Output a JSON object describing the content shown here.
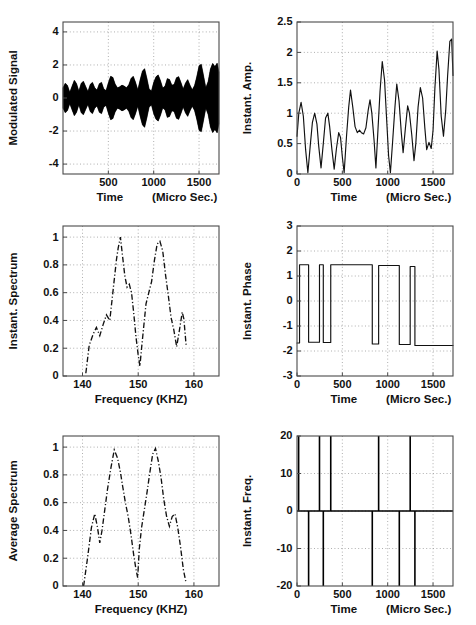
{
  "figure": {
    "width": 476,
    "height": 625,
    "background": "#ffffff",
    "line_color": "#111111",
    "grid_color": "#9a9a9a",
    "axis_color": "#4a4a4a",
    "panel_count": 6
  },
  "panels": [
    {
      "id": "modulated-signal",
      "ylabel": "Modulated Signal",
      "xlabel_left": "Time",
      "xlabel_right": "(Micro Sec.)",
      "xticks": [
        500,
        1000,
        1500
      ],
      "xticklabels": [
        "500",
        "1000",
        "1500"
      ],
      "yticks": [
        -4,
        -2,
        0,
        2,
        4
      ],
      "yticklabels": [
        "-4",
        "-2",
        "0",
        "2",
        "4"
      ],
      "xlim": [
        0,
        1720
      ],
      "ylim": [
        -4.6,
        4.6
      ]
    },
    {
      "id": "instant-amplitude",
      "ylabel": "Instant. Amp.",
      "xlabel_left": "Time",
      "xlabel_right": "(Micro Sec.)",
      "xticks": [
        0,
        500,
        1000,
        1500
      ],
      "xticklabels": [
        "0",
        "500",
        "1000",
        "1500"
      ],
      "yticks": [
        0,
        0.5,
        1,
        1.5,
        2,
        2.5
      ],
      "yticklabels": [
        "0",
        "0.5",
        "1",
        "1.5",
        "2",
        "2.5"
      ],
      "xlim": [
        0,
        1720
      ],
      "ylim": [
        0,
        2.5
      ]
    },
    {
      "id": "instant-spectrum",
      "ylabel": "Instant. Spectrum",
      "xlabel_left": "Frequency (KHZ)",
      "xlabel_right": "",
      "xticks": [
        140,
        150,
        160
      ],
      "xticklabels": [
        "140",
        "150",
        "160"
      ],
      "yticks": [
        0,
        0.2,
        0.4,
        0.6,
        0.8,
        1
      ],
      "yticklabels": [
        "0",
        "0.2",
        "0.4",
        "0.6",
        "0.8",
        "1"
      ],
      "xlim": [
        136.5,
        164.5
      ],
      "ylim": [
        0,
        1.08
      ]
    },
    {
      "id": "instant-phase",
      "ylabel": "Instant. Phase",
      "xlabel_left": "Time",
      "xlabel_right": "(Micro Sec.)",
      "xticks": [
        0,
        500,
        1000,
        1500
      ],
      "xticklabels": [
        "0",
        "500",
        "1000",
        "1500"
      ],
      "yticks": [
        -3,
        -2,
        -1,
        0,
        1,
        2,
        3
      ],
      "yticklabels": [
        "-3",
        "-2",
        "-1",
        "0",
        "1",
        "2",
        "3"
      ],
      "xlim": [
        0,
        1720
      ],
      "ylim": [
        -3,
        3
      ]
    },
    {
      "id": "average-spectrum",
      "ylabel": "Average Spectrum",
      "xlabel_left": "Frequency (KHZ)",
      "xlabel_right": "",
      "xticks": [
        140,
        150,
        160
      ],
      "xticklabels": [
        "140",
        "150",
        "160"
      ],
      "yticks": [
        0,
        0.2,
        0.4,
        0.6,
        0.8,
        1
      ],
      "yticklabels": [
        "0",
        "0.2",
        "0.4",
        "0.6",
        "0.8",
        "1"
      ],
      "xlim": [
        136.5,
        164.5
      ],
      "ylim": [
        0,
        1.08
      ]
    },
    {
      "id": "instant-frequency",
      "ylabel": "Instant. Freq.",
      "xlabel_left": "Time",
      "xlabel_right": "(Micro Sec.)",
      "xticks": [
        0,
        500,
        1000,
        1500
      ],
      "xticklabels": [
        "0",
        "500",
        "1000",
        "1500"
      ],
      "yticks": [
        -20,
        -10,
        0,
        10,
        20
      ],
      "yticklabels": [
        "-20",
        "-10",
        "0",
        "10",
        "20"
      ],
      "xlim": [
        0,
        1720
      ],
      "ylim": [
        -20,
        20
      ]
    }
  ],
  "chart_data": [
    {
      "type": "line",
      "id": "modulated-signal",
      "title": "",
      "xlabel": "Time (Micro Sec.)",
      "ylabel": "Modulated Signal",
      "xlim": [
        0,
        1720
      ],
      "ylim": [
        -4.6,
        4.6
      ],
      "grid": true,
      "description": "Amplitude-modulated carrier filled black; plotted as upper/lower envelope of a dense high-frequency oscillation.",
      "envelope_x": [
        0,
        25,
        50,
        75,
        100,
        125,
        150,
        175,
        200,
        225,
        250,
        275,
        300,
        325,
        350,
        375,
        400,
        425,
        450,
        475,
        500,
        525,
        550,
        575,
        600,
        625,
        650,
        675,
        700,
        725,
        750,
        775,
        800,
        825,
        850,
        875,
        900,
        925,
        950,
        975,
        1000,
        1025,
        1050,
        1075,
        1100,
        1125,
        1150,
        1175,
        1200,
        1225,
        1250,
        1275,
        1300,
        1325,
        1350,
        1375,
        1400,
        1425,
        1450,
        1475,
        1500,
        1525,
        1550,
        1575,
        1600,
        1625,
        1650,
        1675,
        1700,
        1720
      ],
      "envelope_y": [
        0.62,
        0.9,
        0.75,
        0.35,
        0.72,
        1.08,
        0.86,
        0.42,
        0.88,
        1.02,
        0.7,
        0.4,
        0.82,
        0.95,
        0.62,
        0.48,
        0.86,
        0.95,
        0.55,
        0.45,
        0.92,
        1.32,
        1.25,
        0.85,
        0.62,
        0.68,
        0.78,
        0.72,
        0.62,
        0.8,
        1.18,
        1.32,
        0.95,
        0.5,
        1.1,
        1.62,
        1.78,
        1.2,
        0.55,
        0.42,
        0.95,
        1.28,
        1.4,
        1.05,
        0.6,
        0.72,
        1.18,
        1.12,
        0.78,
        0.82,
        1.22,
        1.3,
        0.95,
        0.55,
        0.9,
        1.12,
        0.78,
        0.5,
        0.75,
        1.3,
        1.95,
        2.05,
        1.35,
        0.62,
        1.0,
        1.75,
        2.1,
        1.9,
        2.12,
        1.55
      ]
    },
    {
      "type": "line",
      "id": "instant-amplitude",
      "title": "",
      "xlabel": "Time (Micro Sec.)",
      "ylabel": "Instant. Amp.",
      "xlim": [
        0,
        1720
      ],
      "ylim": [
        0,
        2.5
      ],
      "grid": true,
      "x": [
        0,
        20,
        45,
        70,
        95,
        120,
        145,
        170,
        195,
        220,
        240,
        265,
        290,
        315,
        340,
        360,
        385,
        410,
        435,
        460,
        480,
        500,
        520,
        545,
        570,
        590,
        615,
        640,
        665,
        690,
        710,
        735,
        760,
        785,
        805,
        825,
        850,
        870,
        890,
        915,
        940,
        965,
        990,
        1010,
        1030,
        1055,
        1080,
        1100,
        1125,
        1150,
        1170,
        1195,
        1220,
        1240,
        1265,
        1290,
        1310,
        1335,
        1360,
        1385,
        1410,
        1430,
        1455,
        1480,
        1500,
        1520,
        1545,
        1565,
        1590,
        1615,
        1640,
        1660,
        1685,
        1705,
        1720
      ],
      "y": [
        0.62,
        1.0,
        1.18,
        0.95,
        0.4,
        0.02,
        0.45,
        0.85,
        1.0,
        0.82,
        0.45,
        0.1,
        0.5,
        0.92,
        1.0,
        0.78,
        0.4,
        0.08,
        0.42,
        0.68,
        0.6,
        0.28,
        0.02,
        0.6,
        1.1,
        1.38,
        1.1,
        0.78,
        0.68,
        0.72,
        0.68,
        0.66,
        0.76,
        1.05,
        1.22,
        1.0,
        0.55,
        0.1,
        0.65,
        1.35,
        1.85,
        1.55,
        0.85,
        0.3,
        0.02,
        0.55,
        1.1,
        1.48,
        1.2,
        0.68,
        0.35,
        0.75,
        1.12,
        1.0,
        0.65,
        0.22,
        0.5,
        1.1,
        1.42,
        1.25,
        0.75,
        0.4,
        0.52,
        0.42,
        0.72,
        1.4,
        2.02,
        1.72,
        0.95,
        0.62,
        1.05,
        1.6,
        2.18,
        2.22,
        1.62
      ]
    },
    {
      "type": "line",
      "id": "instant-spectrum",
      "title": "",
      "xlabel": "Frequency (KHZ)",
      "ylabel": "Instant. Spectrum",
      "xlim": [
        136.5,
        164.5
      ],
      "ylim": [
        0,
        1.08
      ],
      "grid": true,
      "linestyle": "dash-dot",
      "x": [
        140.6,
        141.2,
        141.9,
        142.5,
        143.1,
        143.7,
        144.3,
        144.9,
        145.5,
        146.1,
        146.4,
        146.8,
        147.2,
        147.6,
        148.0,
        148.4,
        148.8,
        149.2,
        149.6,
        150.0,
        150.3,
        150.6,
        151.0,
        151.4,
        151.9,
        152.4,
        152.9,
        153.4,
        153.9,
        154.4,
        154.9,
        155.4,
        155.9,
        156.4,
        156.9,
        157.4,
        157.9,
        158.2,
        158.6
      ],
      "y": [
        0.02,
        0.22,
        0.3,
        0.35,
        0.29,
        0.37,
        0.44,
        0.4,
        0.62,
        0.84,
        0.92,
        1.0,
        0.86,
        0.72,
        0.64,
        0.66,
        0.6,
        0.45,
        0.28,
        0.15,
        0.07,
        0.2,
        0.36,
        0.52,
        0.6,
        0.68,
        0.83,
        0.95,
        0.97,
        0.9,
        0.73,
        0.58,
        0.42,
        0.33,
        0.21,
        0.33,
        0.46,
        0.41,
        0.22,
        0.04
      ]
    },
    {
      "type": "line",
      "id": "instant-phase",
      "title": "",
      "xlabel": "Time (Micro Sec.)",
      "ylabel": "Instant. Phase",
      "xlim": [
        0,
        1720
      ],
      "ylim": [
        -3,
        3
      ],
      "grid": true,
      "description": "Binary phase-shift keyed square wave toggling between approximately +1.45 and -1.68 radians.",
      "high_level": 1.45,
      "low_level": -1.68,
      "transitions": [
        0,
        28,
        128,
        248,
        290,
        372,
        830,
        900,
        1128,
        1248,
        1300,
        1470
      ],
      "segments": [
        {
          "x0": 0,
          "x1": 28,
          "level": -1.68
        },
        {
          "x0": 28,
          "x1": 128,
          "level": 1.45
        },
        {
          "x0": 128,
          "x1": 248,
          "level": -1.65
        },
        {
          "x0": 248,
          "x1": 290,
          "level": 1.45
        },
        {
          "x0": 290,
          "x1": 372,
          "level": -1.66
        },
        {
          "x0": 372,
          "x1": 830,
          "level": 1.45
        },
        {
          "x0": 830,
          "x1": 900,
          "level": -1.72
        },
        {
          "x0": 900,
          "x1": 1128,
          "level": 1.42
        },
        {
          "x0": 1128,
          "x1": 1248,
          "level": -1.74
        },
        {
          "x0": 1248,
          "x1": 1300,
          "level": 1.38
        },
        {
          "x0": 1300,
          "x1": 1470,
          "level": -1.78
        },
        {
          "x0": 1470,
          "x1": 1720,
          "level": -1.78
        }
      ]
    },
    {
      "type": "line",
      "id": "average-spectrum",
      "title": "",
      "xlabel": "Frequency (KHZ)",
      "ylabel": "Average Spectrum",
      "xlim": [
        136.5,
        164.5
      ],
      "ylim": [
        0,
        1.08
      ],
      "grid": true,
      "linestyle": "dash-dot",
      "x": [
        140.2,
        140.9,
        141.6,
        142.2,
        142.7,
        143.1,
        143.5,
        144.0,
        144.5,
        145.1,
        145.7,
        146.3,
        146.8,
        147.2,
        147.7,
        148.2,
        148.7,
        149.2,
        149.6,
        149.9,
        150.2,
        150.6,
        151.1,
        151.6,
        152.1,
        152.6,
        153.1,
        153.6,
        154.1,
        154.6,
        155.1,
        155.6,
        156.1,
        156.6,
        157.1,
        157.6,
        158.1,
        158.6
      ],
      "y": [
        0.0,
        0.2,
        0.42,
        0.52,
        0.42,
        0.31,
        0.4,
        0.55,
        0.7,
        0.85,
        0.98,
        0.92,
        0.82,
        0.72,
        0.6,
        0.5,
        0.37,
        0.22,
        0.12,
        0.06,
        0.27,
        0.42,
        0.55,
        0.68,
        0.82,
        0.95,
        0.99,
        0.9,
        0.78,
        0.62,
        0.5,
        0.43,
        0.5,
        0.52,
        0.42,
        0.28,
        0.12,
        0.02
      ]
    },
    {
      "type": "line",
      "id": "instant-frequency",
      "title": "",
      "xlabel": "Time (Micro Sec.)",
      "ylabel": "Instant. Freq.",
      "xlim": [
        0,
        1720
      ],
      "ylim": [
        -20,
        20
      ],
      "grid": true,
      "description": "Derivative of the instantaneous phase: clipped impulses alternating to +20 and -20 at each phase transition, baseline at 0.",
      "baseline": 0,
      "spikes": [
        {
          "x": 18,
          "direction": 20
        },
        {
          "x": 128,
          "direction": -20
        },
        {
          "x": 248,
          "direction": 20
        },
        {
          "x": 290,
          "direction": -20
        },
        {
          "x": 372,
          "direction": 20
        },
        {
          "x": 830,
          "direction": -20
        },
        {
          "x": 900,
          "direction": 20
        },
        {
          "x": 1128,
          "direction": -20
        },
        {
          "x": 1248,
          "direction": 20
        },
        {
          "x": 1300,
          "direction": -20
        }
      ]
    }
  ]
}
